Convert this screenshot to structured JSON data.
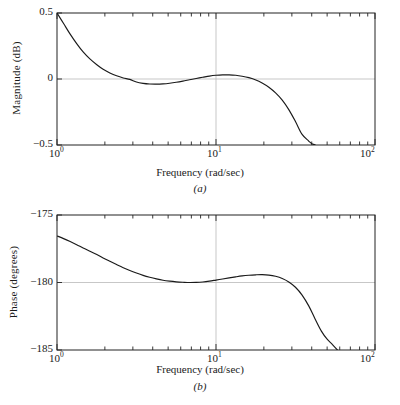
{
  "figure": {
    "background": "#ffffff",
    "axis_color": "#222222",
    "grid_color": "#b9b9b9",
    "curve_color": "#1a1a1a"
  },
  "panels": [
    {
      "id": "a",
      "caption": "(a)",
      "xlabel": "Frequency (rad/sec)",
      "ylabel": "Magnitude (dB)",
      "yticks": [
        "0.5",
        "0",
        "−0.5"
      ],
      "xticks": [
        "10",
        "10",
        "10"
      ],
      "xtick_exponents": [
        "0",
        "1",
        "2"
      ]
    },
    {
      "id": "b",
      "caption": "(b)",
      "xlabel": "Frequency (rad/sec)",
      "ylabel": "Phase (degrees)",
      "yticks": [
        "−175",
        "−180",
        "−185"
      ],
      "xticks": [
        "10",
        "10",
        "10"
      ],
      "xtick_exponents": [
        "0",
        "1",
        "2"
      ]
    }
  ],
  "chart_data": [
    {
      "type": "line",
      "title": "(a)",
      "xlabel": "Frequency (rad/sec)",
      "ylabel": "Magnitude (dB)",
      "xscale": "log",
      "xlim": [
        1,
        100
      ],
      "ylim": [
        -0.5,
        0.5
      ],
      "ytick_values": [
        0.5,
        0,
        -0.5
      ],
      "xtick_values": [
        1,
        10,
        100
      ],
      "grid": true,
      "gridlines": {
        "x": [
          10
        ],
        "y": [
          0
        ]
      },
      "legend": null,
      "series": [
        {
          "name": "magnitude",
          "x": [
            1.0,
            1.1,
            1.21,
            1.33,
            1.46,
            1.61,
            1.78,
            1.95,
            2.15,
            2.37,
            2.61,
            2.87,
            3.16,
            3.48,
            3.83,
            4.22,
            4.64,
            5.11,
            5.62,
            6.19,
            6.81,
            7.5,
            8.25,
            9.09,
            10.0,
            11.0,
            12.1,
            13.3,
            14.6,
            16.1,
            17.8,
            19.5,
            21.5,
            23.7,
            26.1,
            28.7,
            31.6,
            34.8,
            38.3,
            40.0,
            42.0,
            44.0,
            46.0
          ],
          "y": [
            0.5,
            0.42,
            0.34,
            0.268,
            0.205,
            0.152,
            0.108,
            0.074,
            0.046,
            0.024,
            0.008,
            -0.003,
            -0.023,
            -0.033,
            -0.038,
            -0.039,
            -0.037,
            -0.032,
            -0.025,
            -0.016,
            -0.006,
            0.004,
            0.013,
            0.022,
            0.028,
            0.031,
            0.031,
            0.028,
            0.021,
            0.01,
            -0.007,
            -0.03,
            -0.062,
            -0.105,
            -0.16,
            -0.232,
            -0.322,
            -0.42,
            -0.47,
            -0.49,
            -0.5,
            -0.52,
            -0.56
          ]
        }
      ]
    },
    {
      "type": "line",
      "title": "(b)",
      "xlabel": "Frequency (rad/sec)",
      "ylabel": "Phase (degrees)",
      "xscale": "log",
      "xlim": [
        1,
        100
      ],
      "ylim": [
        -185,
        -175
      ],
      "ytick_values": [
        -175,
        -180,
        -185
      ],
      "xtick_values": [
        1,
        10,
        100
      ],
      "grid": true,
      "gridlines": {
        "x": [
          10
        ],
        "y": [
          -180
        ]
      },
      "legend": null,
      "series": [
        {
          "name": "phase",
          "x": [
            1.0,
            1.1,
            1.21,
            1.33,
            1.46,
            1.61,
            1.78,
            1.95,
            2.15,
            2.37,
            2.61,
            2.87,
            3.16,
            3.48,
            3.83,
            4.22,
            4.64,
            5.11,
            5.62,
            6.19,
            6.81,
            7.5,
            8.25,
            9.09,
            10.0,
            11.0,
            12.1,
            13.3,
            14.6,
            16.1,
            17.8,
            19.5,
            21.5,
            23.7,
            26.1,
            28.7,
            31.6,
            34.8,
            38.3,
            42.0,
            46.0,
            50.0,
            54.0,
            58.0,
            61.0
          ],
          "y": [
            -176.55,
            -176.75,
            -176.97,
            -177.2,
            -177.44,
            -177.68,
            -177.93,
            -178.18,
            -178.43,
            -178.67,
            -178.9,
            -179.11,
            -179.3,
            -179.47,
            -179.61,
            -179.73,
            -179.83,
            -179.9,
            -179.95,
            -179.98,
            -180.0,
            -179.99,
            -179.96,
            -179.9,
            -179.82,
            -179.74,
            -179.66,
            -179.58,
            -179.51,
            -179.46,
            -179.43,
            -179.42,
            -179.45,
            -179.54,
            -179.7,
            -179.96,
            -180.35,
            -180.93,
            -181.73,
            -182.7,
            -183.6,
            -184.2,
            -184.6,
            -185.0,
            -185.3
          ]
        }
      ]
    }
  ]
}
